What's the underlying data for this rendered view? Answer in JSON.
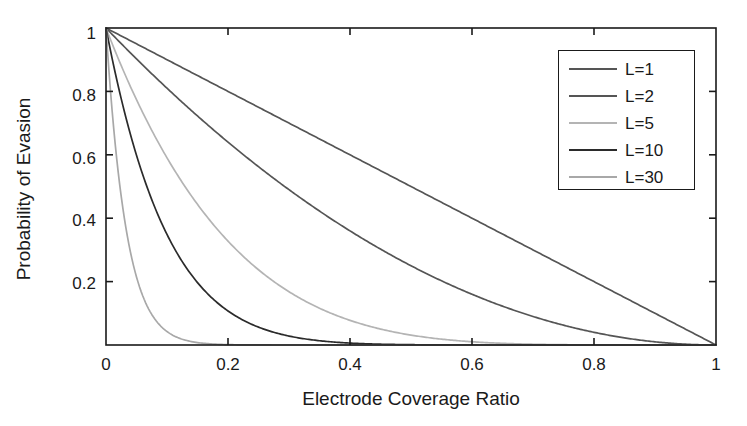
{
  "chart_data": {
    "type": "line",
    "title": "",
    "xlabel": "Electrode Coverage Ratio",
    "ylabel": "Probability of Evasion",
    "xlim": [
      0,
      1
    ],
    "ylim": [
      0,
      1
    ],
    "grid": false,
    "legend_position": "top-right",
    "xticks": [
      "0",
      "0.2",
      "0.4",
      "0.6",
      "0.8",
      "1"
    ],
    "xtick_values": [
      0,
      0.2,
      0.4,
      0.6,
      0.8,
      1
    ],
    "yticks": [
      "0.2",
      "0.4",
      "0.6",
      "0.8",
      "1"
    ],
    "ytick_values": [
      0.2,
      0.4,
      0.6,
      0.8,
      1
    ],
    "x": [
      0,
      0.05,
      0.1,
      0.15,
      0.2,
      0.25,
      0.3,
      0.35,
      0.4,
      0.45,
      0.5,
      0.55,
      0.6,
      0.65,
      0.7,
      0.75,
      0.8,
      0.85,
      0.9,
      0.95,
      1
    ],
    "series": [
      {
        "name": "L=1",
        "color": "#555555",
        "values": [
          1,
          0.95,
          0.9,
          0.85,
          0.8,
          0.75,
          0.7,
          0.65,
          0.6,
          0.55,
          0.5,
          0.45,
          0.4,
          0.35,
          0.3,
          0.25,
          0.2,
          0.15,
          0.1,
          0.05,
          0
        ]
      },
      {
        "name": "L=2",
        "color": "#555555",
        "values": [
          1,
          0.9025,
          0.81,
          0.7225,
          0.64,
          0.5625,
          0.49,
          0.4225,
          0.36,
          0.3025,
          0.25,
          0.2025,
          0.16,
          0.1225,
          0.09,
          0.0625,
          0.04,
          0.0225,
          0.01,
          0.0025,
          0
        ]
      },
      {
        "name": "L=5",
        "color": "#b4b4b4",
        "values": [
          1,
          0.7738,
          0.5905,
          0.4437,
          0.3277,
          0.2373,
          0.1681,
          0.116,
          0.0778,
          0.0503,
          0.0313,
          0.0185,
          0.0102,
          0.0053,
          0.0024,
          0.001,
          0.0003,
          0.0001,
          1e-05,
          3e-07,
          0
        ]
      },
      {
        "name": "L=10",
        "color": "#2b2b2b",
        "values": [
          1,
          0.5987,
          0.3487,
          0.1969,
          0.1074,
          0.0563,
          0.0282,
          0.0135,
          0.006,
          0.0025,
          0.001,
          0.0003,
          0.0001,
          3e-05,
          6e-06,
          1e-06,
          1e-07,
          0,
          0,
          0,
          0
        ]
      },
      {
        "name": "L=30",
        "color": "#a8a8a8",
        "values": [
          1,
          0.2146,
          0.0424,
          0.0076,
          0.0012,
          0.0002,
          2e-05,
          2e-06,
          2e-07,
          0,
          0,
          0,
          0,
          0,
          0,
          0,
          0,
          0,
          0,
          0,
          0
        ]
      }
    ]
  },
  "legend": {
    "items": [
      {
        "label": "L=1"
      },
      {
        "label": "L=2"
      },
      {
        "label": "L=5"
      },
      {
        "label": "L=10"
      },
      {
        "label": "L=30"
      }
    ]
  },
  "axes": {
    "frame_color": "#1a1a1a"
  }
}
